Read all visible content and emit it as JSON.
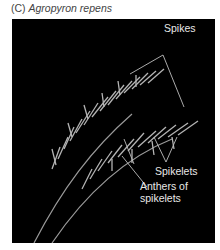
{
  "figure": {
    "panel_letter": "(C)",
    "species": "Agropyron repens",
    "background_color": "#000000",
    "labels": {
      "spikes": "Spikes",
      "spikelets": "Spikelets",
      "anthers_line1": "Anthers of",
      "anthers_line2": "spikelets"
    }
  }
}
